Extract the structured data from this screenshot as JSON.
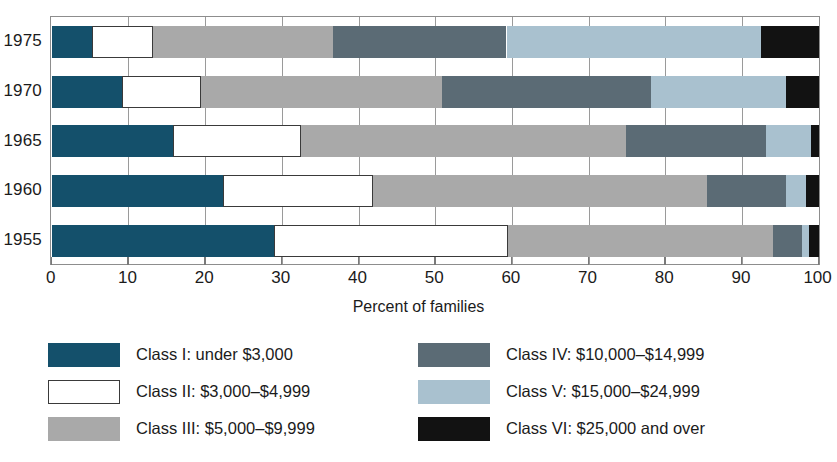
{
  "chart_data": {
    "type": "bar",
    "orientation": "horizontal",
    "stacked": true,
    "stack_mode": "percent",
    "title": "",
    "xlabel": "Percent of families",
    "ylabel": "",
    "xlim": [
      0,
      100
    ],
    "xticks": [
      0,
      10,
      20,
      30,
      40,
      50,
      60,
      70,
      80,
      90,
      100
    ],
    "xtick_labels": [
      "0",
      "10",
      "20",
      "30",
      "40",
      "50",
      "60",
      "70",
      "80",
      "90",
      "100"
    ],
    "grid": true,
    "grid_axis": "x",
    "legend_position": "bottom",
    "categories": [
      "1975",
      "1970",
      "1965",
      "1960",
      "1955"
    ],
    "series": [
      {
        "name": "Class I: under $3,000",
        "color": "#14506b",
        "values": [
          5.2,
          9.1,
          15.8,
          22.3,
          29.0
        ]
      },
      {
        "name": "Class II: $3,000–$4,999",
        "color": "#ffffff",
        "values": [
          8.0,
          10.4,
          16.7,
          19.6,
          30.5
        ]
      },
      {
        "name": "Class III: $5,000–$9,999",
        "color": "#a9a9a9",
        "values": [
          23.5,
          31.4,
          42.4,
          43.6,
          34.5
        ]
      },
      {
        "name": "Class IV: $10,000–$14,999",
        "color": "#5b6b75",
        "values": [
          22.6,
          27.3,
          18.2,
          10.2,
          3.8
        ]
      },
      {
        "name": "Class V: $15,000–$24,999",
        "color": "#a9c1cf",
        "values": [
          33.2,
          17.6,
          5.9,
          2.7,
          0.9
        ]
      },
      {
        "name": "Class VI: $25,000 and over",
        "color": "#121212",
        "values": [
          7.5,
          4.2,
          1.0,
          1.6,
          1.3
        ]
      }
    ]
  },
  "legend": {
    "columns": [
      {
        "items": [
          {
            "label": "Class I: under $3,000",
            "swatch": "c1"
          },
          {
            "label": "Class II: $3,000–$4,999",
            "swatch": "c2"
          },
          {
            "label": "Class III: $5,000–$9,999",
            "swatch": "c3"
          }
        ]
      },
      {
        "items": [
          {
            "label": "Class IV: $10,000–$14,999",
            "swatch": "c4"
          },
          {
            "label": "Class V: $15,000–$24,999",
            "swatch": "c5"
          },
          {
            "label": "Class VI: $25,000 and over",
            "swatch": "c6"
          }
        ]
      }
    ]
  }
}
